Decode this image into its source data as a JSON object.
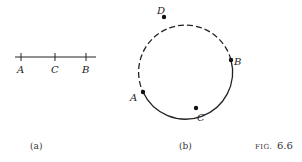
{
  "figure": {
    "caption_prefix": "FIG.",
    "caption_number": "6.6"
  },
  "panel_a": {
    "label": "(a)",
    "points": [
      {
        "name": "A",
        "x": 20
      },
      {
        "name": "C",
        "x": 55
      },
      {
        "name": "B",
        "x": 87
      }
    ]
  },
  "panel_b": {
    "label": "(b)",
    "circle": {
      "cx": 184,
      "cy": 60,
      "r": 47
    },
    "points": [
      {
        "name": "D"
      },
      {
        "name": "B"
      },
      {
        "name": "C"
      },
      {
        "name": "A"
      }
    ],
    "solid_arc": "A to B via C",
    "dashed_arc": "B to A via D"
  }
}
